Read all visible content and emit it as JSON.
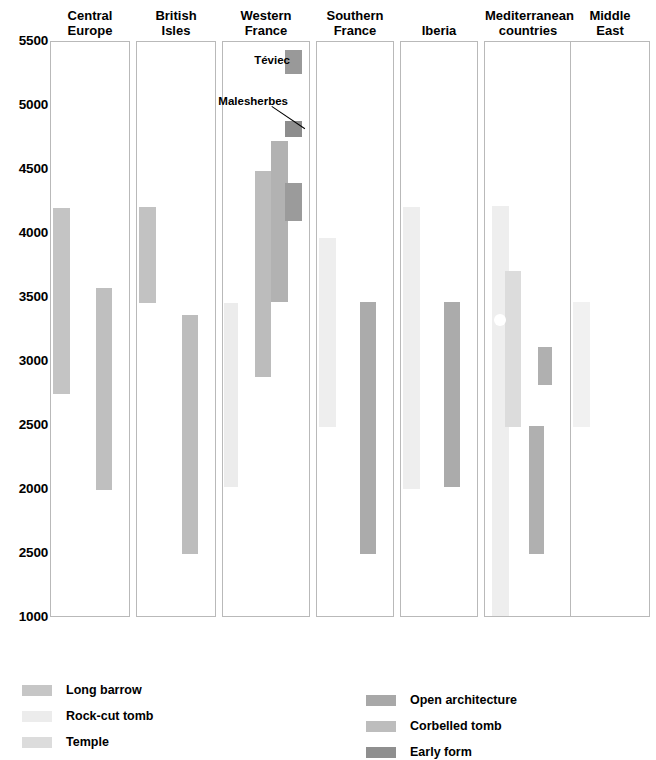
{
  "chart_data": {
    "type": "bar",
    "title": "",
    "xlabel": "",
    "ylabel": "",
    "orientation": "vertical-ranges",
    "grid": false,
    "ylim": [
      1000,
      5500
    ],
    "y_axis_note": "Axis tick labels as printed in the figure; the 8th label reads 2500 (an apparent typo for 1500).",
    "y_ticks": [
      {
        "label": "5500",
        "value": 5500
      },
      {
        "label": "5000",
        "value": 5000
      },
      {
        "label": "4500",
        "value": 4500
      },
      {
        "label": "4000",
        "value": 4000
      },
      {
        "label": "3500",
        "value": 3500
      },
      {
        "label": "3000",
        "value": 3000
      },
      {
        "label": "2500",
        "value": 2500
      },
      {
        "label": "2000",
        "value": 2000
      },
      {
        "label": "2500",
        "value": 1500
      },
      {
        "label": "1000",
        "value": 1000
      }
    ],
    "legend_position": "bottom",
    "legend": [
      {
        "key": "long_barrow",
        "label": "Long barrow",
        "color": "#c6c6c6"
      },
      {
        "key": "rock_cut_tomb",
        "label": "Rock-cut tomb",
        "color": "#ececec"
      },
      {
        "key": "temple",
        "label": "Temple",
        "color": "#dcdcdc"
      },
      {
        "key": "open_architecture",
        "label": "Open architecture",
        "color": "#a8a8a8"
      },
      {
        "key": "corbelled_tomb",
        "label": "Corbelled tomb",
        "color": "#bdbdbd"
      },
      {
        "key": "early_form",
        "label": "Early form",
        "color": "#8f8f8f"
      }
    ],
    "categories": [
      "Central Europe",
      "British Isles",
      "Western France",
      "Southern France",
      "Iberia",
      "Mediterranean countries",
      "Middle East"
    ],
    "panels": [
      {
        "name": "Central Europe",
        "title": "Central\nEurope",
        "bars": [
          {
            "series": "long_barrow",
            "from": 4200,
            "to": 2750,
            "slot": 0,
            "color": "#c4c4c4"
          },
          {
            "series": "open_architecture",
            "from": 3580,
            "to": 2000,
            "slot": 1,
            "color": "#bfbfbf"
          }
        ]
      },
      {
        "name": "British Isles",
        "title": "British\nIsles",
        "bars": [
          {
            "series": "long_barrow",
            "from": 4210,
            "to": 3460,
            "slot": 0,
            "color": "#c2c2c2"
          },
          {
            "series": "open_architecture",
            "from": 3370,
            "to": 1500,
            "slot": 1,
            "color": "#bdbdbd"
          }
        ]
      },
      {
        "name": "Western France",
        "title": "Western\nFrance",
        "bars": [
          {
            "series": "rock_cut_tomb",
            "from": 3460,
            "to": 2020,
            "slot": 0,
            "color": "#ececec"
          },
          {
            "series": "corbelled_tomb",
            "from": 4490,
            "to": 2880,
            "slot": 1,
            "color": "#bcbcbc"
          },
          {
            "series": "open_architecture",
            "from": 4730,
            "to": 3470,
            "slot": 2,
            "color": "#b2b2b2"
          },
          {
            "series": "early_form",
            "from": 5440,
            "to": 5250,
            "slot": 3,
            "color": "#999999"
          },
          {
            "series": "early_form",
            "from": 4880,
            "to": 4760,
            "slot": 3,
            "color": "#8d8d8d"
          },
          {
            "series": "early_form",
            "from": 4400,
            "to": 4100,
            "slot": 3,
            "color": "#9b9b9b"
          }
        ],
        "annotations": [
          {
            "text": "Téviec",
            "target_series": "early_form",
            "leader": false
          },
          {
            "text": "Malesherbes",
            "target_series": "early_form",
            "leader": true
          }
        ]
      },
      {
        "name": "Southern France",
        "title": "Southern\nFrance",
        "bars": [
          {
            "series": "rock_cut_tomb",
            "from": 3970,
            "to": 2490,
            "slot": 0,
            "color": "#eeeeee"
          },
          {
            "series": "open_architecture",
            "from": 3470,
            "to": 1500,
            "slot": 1,
            "color": "#ababab"
          }
        ]
      },
      {
        "name": "Iberia",
        "title": "Iberia",
        "bars": [
          {
            "series": "rock_cut_tomb",
            "from": 4210,
            "to": 2010,
            "slot": 0,
            "color": "#eeeeee"
          },
          {
            "series": "open_architecture",
            "from": 3470,
            "to": 2020,
            "slot": 1,
            "color": "#ababab"
          }
        ]
      },
      {
        "name": "Mediterranean countries",
        "title": "Mediterranean\ncountries",
        "bars": [
          {
            "series": "rock_cut_tomb",
            "from": 4220,
            "to": 1000,
            "slot": 0,
            "color": "#eeeeee"
          },
          {
            "series": "temple",
            "from": 3710,
            "to": 2490,
            "slot": 1,
            "color": "#dcdcdc"
          },
          {
            "series": "corbelled_tomb",
            "from": 3120,
            "to": 2820,
            "slot": 2,
            "color": "#b0b0b0"
          },
          {
            "series": "open_architecture",
            "from": 2500,
            "to": 1500,
            "slot": 2,
            "color": "#b0b0b0"
          }
        ],
        "markers": [
          {
            "type": "circle",
            "value": 3330,
            "color": "#ffffff"
          }
        ]
      },
      {
        "name": "Middle East",
        "title": "Middle\nEast",
        "bars": [
          {
            "series": "rock_cut_tomb",
            "from": 3470,
            "to": 2490,
            "slot": 0,
            "color": "#f1f1f1"
          }
        ]
      }
    ]
  }
}
